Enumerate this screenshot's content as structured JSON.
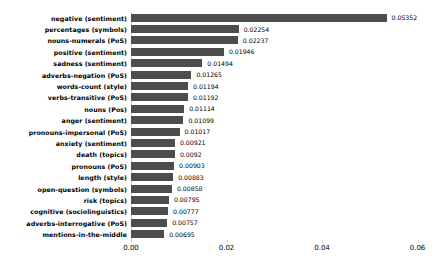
{
  "chart_data": {
    "type": "bar",
    "orientation": "horizontal",
    "title": "",
    "xlabel": "",
    "ylabel": "",
    "xlim": [
      0.0,
      0.06
    ],
    "grid": false,
    "legend": null,
    "bar_color": "#4d4d4d",
    "xticks": [
      "0.00",
      "0.02",
      "0.04",
      "0.06"
    ],
    "xtick_values": [
      0.0,
      0.02,
      0.04,
      0.06
    ],
    "categories": [
      "negative (sentiment)",
      "percentages (symbols)",
      "nouns-numerals (PoS)",
      "positive (sentiment)",
      "sadness (sentiment)",
      "adverbs-negation (PoS)",
      "words-count (style)",
      "verbs-transitive (PoS)",
      "nouns (Pos)",
      "anger (sentiment)",
      "pronouns-impersonal (PoS)",
      "anxiety (sentiment)",
      "death (topics)",
      "pronouns (PoS)",
      "length (style)",
      "open-question (symbols)",
      "risk (topics)",
      "cognitive (sociolinguistics)",
      "adverbs-interrogative (PoS)",
      "mentions-in-the-middle"
    ],
    "values": [
      0.05352,
      0.02254,
      0.02237,
      0.01946,
      0.01494,
      0.01265,
      0.01194,
      0.01192,
      0.01114,
      0.01099,
      0.01017,
      0.00921,
      0.0092,
      0.00903,
      0.00883,
      0.00858,
      0.00795,
      0.00777,
      0.00757,
      0.00695
    ],
    "value_labels": [
      "0.05352",
      "0.02254",
      "0.02237",
      "0.01946",
      "0.01494",
      "0.01265",
      "0.01194",
      "0.01192",
      "0.01114",
      "0.01099",
      "0.01017",
      "0.00921",
      "0.0092",
      "0.00903",
      "0.00883",
      "0.00858",
      "0.00795",
      "0.00777",
      "0.00757",
      "0.00695"
    ]
  }
}
